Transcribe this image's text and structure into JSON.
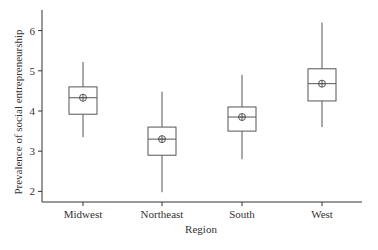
{
  "chart_data": {
    "type": "boxplot",
    "title": "",
    "xlabel": "Region",
    "ylabel": "Prevalence of social entrepreneurship",
    "categories": [
      "Midwest",
      "Northeast",
      "South",
      "West"
    ],
    "series": [
      {
        "name": "Midwest",
        "whisker_low": 3.35,
        "q1": 3.92,
        "median": 4.33,
        "q3": 4.6,
        "whisker_high": 5.22,
        "mean": 4.33
      },
      {
        "name": "Northeast",
        "whisker_low": 1.98,
        "q1": 2.9,
        "median": 3.3,
        "q3": 3.6,
        "whisker_high": 4.48,
        "mean": 3.3
      },
      {
        "name": "South",
        "whisker_low": 2.8,
        "q1": 3.5,
        "median": 3.85,
        "q3": 4.1,
        "whisker_high": 4.9,
        "mean": 3.85
      },
      {
        "name": "West",
        "whisker_low": 3.6,
        "q1": 4.25,
        "median": 4.68,
        "q3": 5.05,
        "whisker_high": 6.2,
        "mean": 4.68
      }
    ],
    "yticks": [
      2,
      3,
      4,
      5,
      6
    ],
    "ylim": [
      1.75,
      6.5
    ],
    "grid": false,
    "legend": null,
    "mean_marker": "circle-plus"
  },
  "axes": {
    "x_title": "Region",
    "y_title": "Prevalence of social entrepreneurship"
  }
}
